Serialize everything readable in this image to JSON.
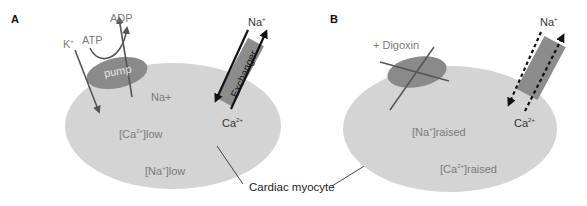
{
  "figure": {
    "panels": [
      {
        "letter": "A",
        "pump_label": "pump",
        "atp_label": "ATP",
        "adp_label": "ADP",
        "k_label": "K",
        "k_sup": "+",
        "na_in_label": "Na+",
        "exchanger_label": "Exchanger",
        "exchanger_na": "Na",
        "exchanger_na_sup": "+",
        "exchanger_ca": "Ca",
        "exchanger_ca_sup": "2+",
        "conc1_pre": "[Ca",
        "conc1_sup": "2+",
        "conc1_post": "]low",
        "conc2_pre": "[Na",
        "conc2_sup": "+",
        "conc2_post": "]low"
      },
      {
        "letter": "B",
        "drug_label": "+ Digoxin",
        "exchanger_na": "Na",
        "exchanger_na_sup": "+",
        "exchanger_ca": "Ca",
        "exchanger_ca_sup": "2+",
        "conc1_pre": "[Na",
        "conc1_sup": "+",
        "conc1_post": "]raised",
        "conc2_pre": "[Ca",
        "conc2_sup": "2+",
        "conc2_post": "]raised"
      }
    ],
    "shared_label": "Cardiac myocyte",
    "colors": {
      "cell": "#d4d4d4",
      "pump": "#8a8a8a",
      "exchanger": "#8c8c8c",
      "arrow": "#555555",
      "black": "#111111",
      "text_grey": "#7a7a7a"
    }
  }
}
